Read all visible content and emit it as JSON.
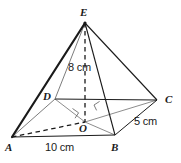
{
  "figure": {
    "type": "geometry-diagram",
    "shape": "square-pyramid",
    "canvas": {
      "width": 181,
      "height": 163
    },
    "colors": {
      "background": "#ffffff",
      "stroke": "#1a1a1a",
      "stroke_light": "#5a5a5a",
      "text": "#1a1a1a"
    },
    "vertices": [
      {
        "id": "E",
        "label": "E",
        "role": "apex",
        "x": 85,
        "y": 23,
        "label_x": 80,
        "label_y": 7
      },
      {
        "id": "D",
        "label": "D",
        "role": "base-corner",
        "x": 55,
        "y": 99,
        "label_x": 43,
        "label_y": 91
      },
      {
        "id": "C",
        "label": "C",
        "role": "base-corner",
        "x": 157,
        "y": 100,
        "label_x": 165,
        "label_y": 94
      },
      {
        "id": "A",
        "label": "A",
        "role": "base-corner",
        "x": 12,
        "y": 137,
        "label_x": 5,
        "label_y": 142
      },
      {
        "id": "B",
        "label": "B",
        "role": "base-corner",
        "x": 115,
        "y": 135,
        "label_x": 111,
        "label_y": 142
      },
      {
        "id": "O",
        "label": "O",
        "role": "base-center",
        "x": 85,
        "y": 122,
        "label_x": 79,
        "label_y": 123
      }
    ],
    "measurements": [
      {
        "id": "height",
        "label": "8 cm",
        "applies_to": "EO",
        "x": 68,
        "y": 62
      },
      {
        "id": "base-ab",
        "label": "10 cm",
        "applies_to": "AB",
        "x": 45,
        "y": 142
      },
      {
        "id": "base-bc",
        "label": "5 cm",
        "applies_to": "BC",
        "x": 134,
        "y": 116
      }
    ],
    "edges": [
      {
        "id": "EA",
        "from": "E",
        "to": "A",
        "style": "solid",
        "weight": "bold",
        "note": "front-left lateral edge"
      },
      {
        "id": "EB",
        "from": "E",
        "to": "B",
        "style": "solid",
        "weight": "normal",
        "note": "front-right lateral edge"
      },
      {
        "id": "EC",
        "from": "E",
        "to": "C",
        "style": "solid",
        "weight": "normal",
        "note": "right lateral edge"
      },
      {
        "id": "ED",
        "from": "E",
        "to": "D",
        "style": "solid",
        "weight": "thin",
        "note": "back-left lateral edge"
      },
      {
        "id": "AB",
        "from": "A",
        "to": "B",
        "style": "solid",
        "weight": "normal",
        "note": "front base edge, 10 cm"
      },
      {
        "id": "BC",
        "from": "B",
        "to": "C",
        "style": "solid",
        "weight": "normal",
        "note": "right base edge, 5 cm"
      },
      {
        "id": "CD",
        "from": "C",
        "to": "D",
        "style": "solid",
        "weight": "normal",
        "note": "back base edge"
      },
      {
        "id": "DA",
        "from": "D",
        "to": "A",
        "style": "solid",
        "weight": "bold",
        "note": "left base edge"
      },
      {
        "id": "EO",
        "from": "E",
        "to": "O",
        "style": "dashed",
        "weight": "normal",
        "note": "perpendicular height, 8 cm"
      },
      {
        "id": "AO",
        "from": "A",
        "to": "O",
        "style": "dashed",
        "weight": "normal",
        "note": "base diagonal half A to centre"
      },
      {
        "id": "OC",
        "from": "O",
        "to": "C",
        "style": "solid",
        "weight": "thin",
        "note": "base diagonal half centre to C"
      },
      {
        "id": "DO",
        "from": "D",
        "to": "O",
        "style": "solid",
        "weight": "thin",
        "note": "base diagonal half D to centre"
      },
      {
        "id": "OB",
        "from": "O",
        "to": "B",
        "style": "solid",
        "weight": "thin",
        "note": "base diagonal half centre to B"
      }
    ],
    "right_angle_markers": [
      {
        "id": "ra-1",
        "at": "O",
        "between": "EO and AC",
        "x": 72,
        "y": 109
      },
      {
        "id": "ra-2",
        "at": "O",
        "between": "EO and DB",
        "x": 96,
        "y": 103
      }
    ]
  }
}
